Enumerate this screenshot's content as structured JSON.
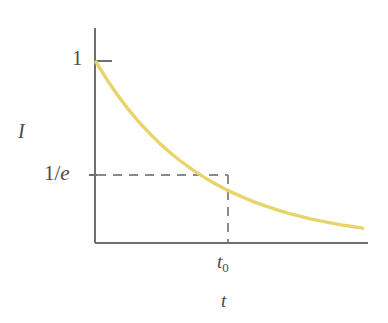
{
  "figure": {
    "kind": "line-plot",
    "background_color": "#ffffff",
    "axis_color": "#6f6f6f",
    "curve_color": "#e8d46a",
    "dash_color": "#8a8a8a",
    "text_color": "#4a4a4a"
  },
  "labels": {
    "y_tick_top": "1",
    "y_tick_mid_prefix": "1/",
    "y_tick_mid_italic": "e",
    "y_axis_title": "I",
    "x_tick_mark": "t",
    "x_tick_mark_sub": "0",
    "x_axis_title": "t"
  },
  "chart_data": {
    "type": "line",
    "title": "",
    "xlabel": "t",
    "ylabel": "I",
    "grid": false,
    "legend": null,
    "function": "I(t) = exp(-t / t0)",
    "xlim": [
      0,
      2.55
    ],
    "ylim": [
      0,
      1.15
    ],
    "xticks": [
      1
    ],
    "xticklabels": [
      "t0"
    ],
    "yticks": [
      0.3679,
      1
    ],
    "yticklabels": [
      "1/e",
      "1"
    ],
    "annotations": [
      {
        "name": "dashed-horizontal",
        "from": [
          0,
          0.3679
        ],
        "to": [
          1,
          0.3679
        ],
        "style": "dashed"
      },
      {
        "name": "dashed-vertical",
        "from": [
          1,
          0.3679
        ],
        "to": [
          1,
          0
        ],
        "style": "dashed"
      }
    ],
    "series": [
      {
        "name": "I(t) = e^(-t/t0)",
        "color": "#e8d46a",
        "x": [
          0,
          0.1,
          0.2,
          0.3,
          0.4,
          0.5,
          0.6,
          0.7,
          0.8,
          0.9,
          1.0,
          1.1,
          1.2,
          1.3,
          1.4,
          1.5,
          1.6,
          1.7,
          1.8,
          1.9,
          2.0,
          2.1,
          2.2,
          2.3,
          2.4,
          2.5
        ],
        "y": [
          1.0,
          0.905,
          0.819,
          0.741,
          0.67,
          0.607,
          0.549,
          0.497,
          0.449,
          0.407,
          0.368,
          0.333,
          0.301,
          0.273,
          0.247,
          0.223,
          0.202,
          0.183,
          0.165,
          0.15,
          0.135,
          0.122,
          0.111,
          0.1,
          0.091,
          0.082
        ]
      }
    ]
  }
}
